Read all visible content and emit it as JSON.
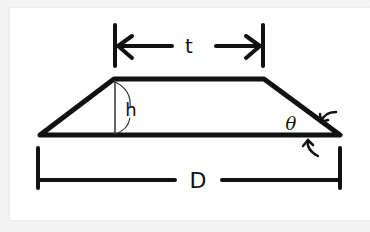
{
  "diagram": {
    "type": "trapezoid-dimension-diagram",
    "labels": {
      "top_width": "t",
      "height": "h",
      "base_width": "D",
      "angle": "θ"
    },
    "colors": {
      "stroke": "#111111",
      "background": "#ffffff"
    }
  }
}
